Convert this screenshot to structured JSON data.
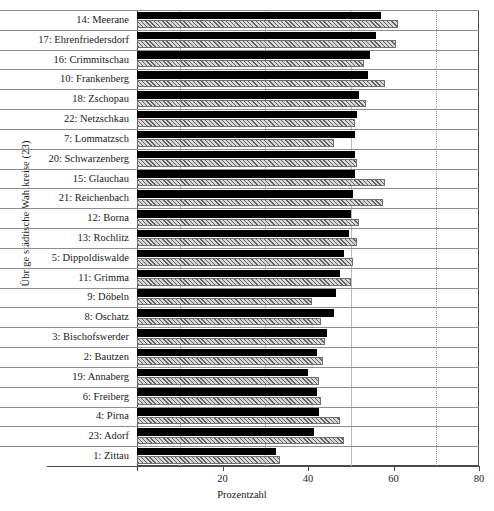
{
  "chart_data": {
    "type": "bar",
    "orientation": "horizontal",
    "title": "",
    "xlabel": "Prozentzahl",
    "ylabel": "Übrige städtische Wahlkreise (23)",
    "xlim": [
      0,
      80
    ],
    "xticks": [
      0,
      20,
      40,
      60,
      80
    ],
    "xticklabels": [
      "",
      "20",
      "40",
      "60",
      "80"
    ],
    "gridlines": [
      10,
      30,
      50,
      70
    ],
    "grid": true,
    "legend": null,
    "categories": [
      "14: Meerane",
      "17: Ehrenfriedersdorf",
      "16: Crimmitschau",
      "10: Frankenberg",
      "18: Zschopau",
      "22: Netzschkau",
      "7: Lommatzsch",
      "20: Schwarzenberg",
      "15: Glauchau",
      "21: Reichenbach",
      "12: Borna",
      "13: Rochlitz",
      "5: Dippoldiswalde",
      "11: Grimma",
      "9: Döbeln",
      "8: Oschatz",
      "3: Bischofswerder",
      "2: Bautzen",
      "19: Annaberg",
      "6: Freiberg",
      "4: Pirna",
      "23: Adorf",
      "1: Zittau"
    ],
    "series": [
      {
        "name": "schwarz",
        "style": "solid-black",
        "color": "#000000",
        "values": [
          57.0,
          56.0,
          54.5,
          54.0,
          52.0,
          51.5,
          51.0,
          51.0,
          51.0,
          50.5,
          50.0,
          49.5,
          48.5,
          47.5,
          46.5,
          46.0,
          44.5,
          42.0,
          40.0,
          42.0,
          42.5,
          41.5,
          32.5
        ]
      },
      {
        "name": "schraffiert",
        "style": "hatched",
        "color": "#d8d8d8",
        "values": [
          61.0,
          60.5,
          53.0,
          58.0,
          53.5,
          51.0,
          46.0,
          51.5,
          58.0,
          57.5,
          52.0,
          51.5,
          50.5,
          50.0,
          41.0,
          43.0,
          44.0,
          43.5,
          42.5,
          43.0,
          47.5,
          48.5,
          33.5
        ]
      }
    ]
  }
}
